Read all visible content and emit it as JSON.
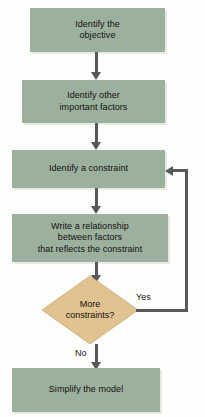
{
  "diagram": {
    "type": "flowchart",
    "background_color": "#fdfdfb",
    "process_fill_color": "#9cb09e",
    "decision_fill_color": "#e0c391",
    "connector_color": "#55595a",
    "text_color": "#14110f",
    "nodes": [
      {
        "id": "identify-objective",
        "shape": "process",
        "label": "Identify the\nobjective"
      },
      {
        "id": "identify-other-factors",
        "shape": "process",
        "label": "Identify other\nimportant factors"
      },
      {
        "id": "identify-constraint",
        "shape": "process",
        "label": "Identify a constraint"
      },
      {
        "id": "write-relationship",
        "shape": "process",
        "label": "Write a relationship\nbetween factors\nthat reflects the constraint"
      },
      {
        "id": "more-constraints",
        "shape": "decision",
        "label": "More\nconstraints?"
      },
      {
        "id": "simplify-model",
        "shape": "process",
        "label": "Simplify the model"
      }
    ],
    "edge_labels": {
      "yes": "Yes",
      "no": "No"
    }
  }
}
